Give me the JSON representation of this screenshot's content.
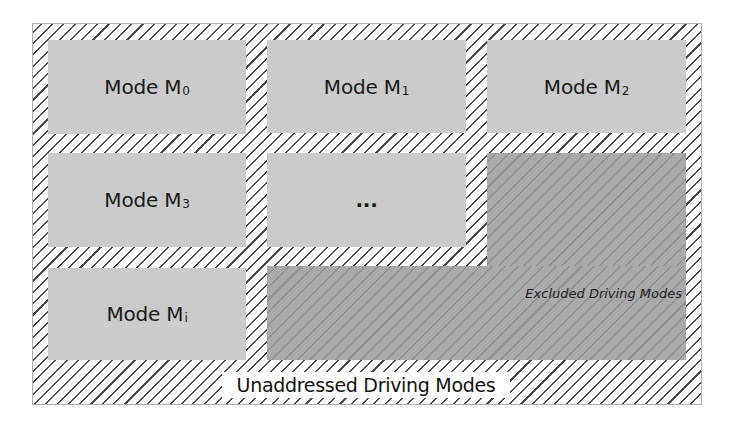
{
  "diagram": {
    "modes": [
      {
        "label": "Mode M",
        "sub": "0"
      },
      {
        "label": "Mode M",
        "sub": "1"
      },
      {
        "label": "Mode M",
        "sub": "2"
      },
      {
        "label": "Mode M",
        "sub": "3"
      },
      {
        "label": "...",
        "sub": ""
      },
      {
        "label": "Mode M",
        "sub": "i"
      }
    ],
    "excluded_label": "Excluded Driving Modes",
    "unaddressed_label": "Unaddressed Driving Modes",
    "colors": {
      "mode_fill": "#cbcbcb",
      "excluded_fill": "#aaaaaa",
      "excluded_hatch": "#919191",
      "unaddressed_hatch": "#4a4a4a",
      "background": "#ffffff"
    }
  }
}
